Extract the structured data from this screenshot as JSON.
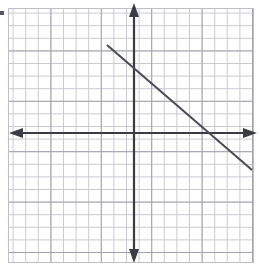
{
  "figure": {
    "title": "Coordinate plane with a straight line graph",
    "width": 260,
    "height": 271,
    "background_color": "#ffffff"
  },
  "grid": {
    "minor_line_color": "#c9c9d2",
    "major_line_color": "#a3a3ae",
    "minor_spacing_px": 12.6,
    "major_every": 4,
    "left_px": 8,
    "top_px": 8,
    "right_px": 253,
    "bottom_px": 262,
    "columns": 20,
    "rows": 20,
    "grid_on": true
  },
  "axes": {
    "color": "#3b3b44",
    "line_width_px": 2.2,
    "origin_px": {
      "x": 134,
      "y": 133
    },
    "x_axis": {
      "name": "x-axis",
      "y_px": 133,
      "start_px": 10,
      "end_px": 256,
      "arrow_left": true,
      "arrow_right": true
    },
    "y_axis": {
      "name": "y-axis",
      "x_px": 134,
      "start_px": 4,
      "end_px": 262,
      "arrow_top": true,
      "arrow_bottom": true
    },
    "tick_labels_visible": false,
    "axis_labels_visible": false
  },
  "artifact": {
    "name": "scan-speck",
    "x_px": 0,
    "y_px": 11,
    "width_px": 4,
    "height_px": 4,
    "color": "#55555f"
  },
  "chart_data": {
    "type": "line",
    "title": "",
    "subtitle": "",
    "xlabel": "",
    "ylabel": "",
    "grid": true,
    "legend": "none",
    "axis_units_per_cell": 1,
    "xlim": [
      -10,
      9.5
    ],
    "ylim": [
      -10.2,
      9.9
    ],
    "series": [
      {
        "name": "line-1",
        "color": "#4a4a54",
        "line_width_px": 2.0,
        "slope": -0.862,
        "y_intercept": 5.0,
        "x_intercept": 6.3,
        "points_px": [
          {
            "x": 107,
            "y": 45
          },
          {
            "x": 252,
            "y": 170
          }
        ],
        "points_data": [
          {
            "x": -2.15,
            "y": 6.98
          },
          {
            "x": 9.37,
            "y": -2.94
          }
        ],
        "endpoints_have_arrows": false
      }
    ]
  }
}
